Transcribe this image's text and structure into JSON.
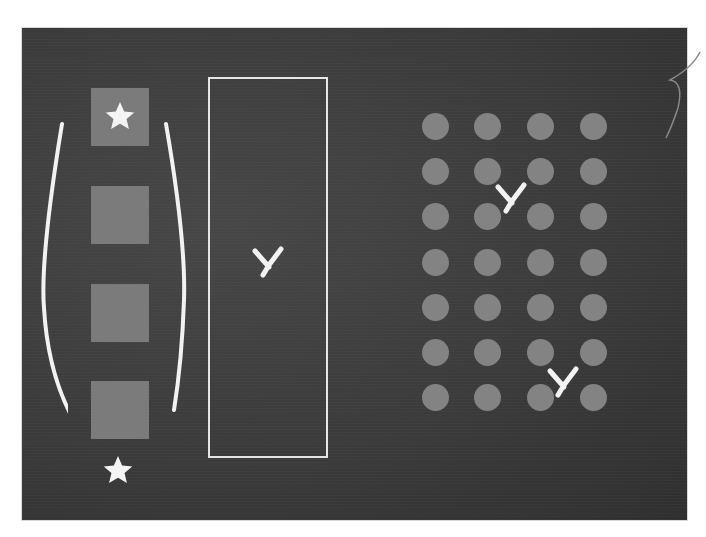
{
  "scene": {
    "description": "Chalkboard illustration with counting/grouping shapes",
    "colors": {
      "board": "#3a3a3a",
      "shape_fill": "#7b7b7b",
      "dot_fill": "#838383",
      "chalk": "#f2f2f2"
    }
  },
  "left_group": {
    "squares": [
      {
        "id": 1,
        "x": 91,
        "y": 88,
        "has_star": true
      },
      {
        "id": 2,
        "x": 91,
        "y": 186,
        "has_star": false
      },
      {
        "id": 3,
        "x": 91,
        "y": 284,
        "has_star": false
      },
      {
        "id": 4,
        "x": 91,
        "y": 381,
        "has_star": false
      }
    ],
    "bracket": "chalk parentheses around squares",
    "bottom_star": {
      "x": 118,
      "y": 470
    }
  },
  "middle_group": {
    "frame": {
      "x": 208,
      "y": 77,
      "width": 120,
      "height": 381
    },
    "mark": {
      "symbol": "x-mark",
      "x": 268,
      "y": 262
    }
  },
  "right_group": {
    "dot_grid": {
      "columns": 4,
      "rows": 7,
      "col_x": [
        435,
        487,
        540,
        593
      ],
      "row_y": [
        126,
        171,
        216,
        262,
        307,
        352,
        397
      ]
    },
    "marks": [
      {
        "symbol": "x-mark",
        "x": 511,
        "y": 198
      },
      {
        "symbol": "x-mark",
        "x": 563,
        "y": 382
      }
    ]
  }
}
